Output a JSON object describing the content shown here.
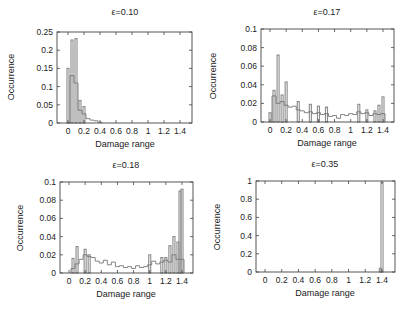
{
  "figure": {
    "panel_count": 4,
    "colors": {
      "frame": "#444444",
      "bar": "#8a8a8a",
      "step": "#777777",
      "dark": "#222222",
      "text": "#222222"
    }
  },
  "chart_data": [
    {
      "type": "bar",
      "title": "ε=0.10",
      "xlabel": "Damage range",
      "ylabel": "Occurrence",
      "xlim": [
        -0.1,
        1.55
      ],
      "ylim": [
        0,
        0.25
      ],
      "xticks": [
        "0",
        "0.2",
        "0.4",
        "0.6",
        "0.8",
        "1",
        "1.2",
        "1.4"
      ],
      "yticks": [
        "0",
        "0.05",
        "0.1",
        "0.15",
        "0.2",
        "0.25"
      ],
      "grid": false,
      "frame": {
        "left": 57,
        "top": 32,
        "right": 192,
        "bottom": 123,
        "x0px": 68,
        "x14px": 180
      },
      "bin_width": 0.025,
      "bars": [
        [
          0.0,
          0.15
        ],
        [
          0.05,
          0.228
        ],
        [
          0.1,
          0.232
        ],
        [
          0.15,
          0.062
        ],
        [
          0.2,
          0.045
        ]
      ],
      "step": [
        [
          0.0,
          0.0
        ],
        [
          0.025,
          0.13
        ],
        [
          0.075,
          0.11
        ],
        [
          0.125,
          0.035
        ],
        [
          0.175,
          0.025
        ],
        [
          0.225,
          0.012
        ],
        [
          0.275,
          0.008
        ],
        [
          0.325,
          0.006
        ],
        [
          0.375,
          0.002
        ],
        [
          0.425,
          0.0
        ]
      ]
    },
    {
      "type": "bar",
      "title": "ε=0.17",
      "xlabel": "Damage range",
      "ylabel": "Occurrence",
      "xlim": [
        -0.1,
        1.55
      ],
      "ylim": [
        0,
        0.1
      ],
      "xticks": [
        "0",
        "0.2",
        "0.4",
        "0.6",
        "0.8",
        "1",
        "1.2",
        "1.4"
      ],
      "yticks": [
        "0",
        "0.02",
        "0.04",
        "0.06",
        "0.08",
        "0.1"
      ],
      "grid": false,
      "frame": {
        "left": 261,
        "top": 29,
        "right": 394,
        "bottom": 122,
        "x0px": 270,
        "x14px": 383
      },
      "bin_width": 0.025,
      "bars": [
        [
          0.0,
          0.01
        ],
        [
          0.05,
          0.034
        ],
        [
          0.1,
          0.072
        ],
        [
          0.15,
          0.029
        ],
        [
          0.2,
          0.043
        ],
        [
          0.35,
          0.022
        ],
        [
          0.5,
          0.019
        ],
        [
          0.6,
          0.017
        ],
        [
          0.7,
          0.016
        ],
        [
          1.1,
          0.019
        ],
        [
          1.2,
          0.013
        ],
        [
          1.3,
          0.012
        ],
        [
          1.35,
          0.018
        ],
        [
          1.4,
          0.027
        ]
      ],
      "step": [
        [
          0.025,
          0.028
        ],
        [
          0.075,
          0.02
        ],
        [
          0.125,
          0.022
        ],
        [
          0.175,
          0.018
        ],
        [
          0.225,
          0.016
        ],
        [
          0.275,
          0.017
        ],
        [
          0.325,
          0.013
        ],
        [
          0.375,
          0.012
        ],
        [
          0.425,
          0.01
        ],
        [
          0.475,
          0.011
        ],
        [
          0.525,
          0.009
        ],
        [
          0.575,
          0.01
        ],
        [
          0.625,
          0.008
        ],
        [
          0.675,
          0.009
        ],
        [
          0.725,
          0.006
        ],
        [
          0.775,
          0.007
        ],
        [
          0.825,
          0.004
        ],
        [
          0.875,
          0.008
        ],
        [
          0.925,
          0.007
        ],
        [
          0.975,
          0.009
        ],
        [
          1.025,
          0.008
        ],
        [
          1.075,
          0.011
        ],
        [
          1.125,
          0.009
        ],
        [
          1.175,
          0.01
        ],
        [
          1.225,
          0.007
        ],
        [
          1.275,
          0.009
        ],
        [
          1.325,
          0.008
        ],
        [
          1.375,
          0.009
        ],
        [
          1.425,
          0.0
        ]
      ]
    },
    {
      "type": "bar",
      "title": "ε=0.18",
      "xlabel": "Damage range",
      "ylabel": "Occurrence",
      "xlim": [
        -0.1,
        1.55
      ],
      "ylim": [
        0,
        0.1
      ],
      "xticks": [
        "0",
        "0.2",
        "0.4",
        "0.6",
        "0.8",
        "1",
        "1.2",
        "1.4"
      ],
      "yticks": [
        "0",
        "0.02",
        "0.04",
        "0.06",
        "0.08",
        "0.1"
      ],
      "grid": false,
      "frame": {
        "left": 60,
        "top": 182,
        "right": 193,
        "bottom": 273,
        "x0px": 69,
        "x14px": 182
      },
      "bin_width": 0.025,
      "bars": [
        [
          0.05,
          0.016
        ],
        [
          0.1,
          0.029
        ],
        [
          0.2,
          0.026
        ],
        [
          0.25,
          0.02
        ],
        [
          1.0,
          0.02
        ],
        [
          1.15,
          0.017
        ],
        [
          1.2,
          0.017
        ],
        [
          1.25,
          0.03
        ],
        [
          1.3,
          0.04
        ],
        [
          1.35,
          0.034
        ],
        [
          1.375,
          0.09
        ],
        [
          1.4,
          0.092
        ]
      ],
      "step": [
        [
          0.025,
          0.005
        ],
        [
          0.075,
          0.01
        ],
        [
          0.125,
          0.015
        ],
        [
          0.175,
          0.02
        ],
        [
          0.225,
          0.018
        ],
        [
          0.275,
          0.017
        ],
        [
          0.325,
          0.013
        ],
        [
          0.375,
          0.011
        ],
        [
          0.425,
          0.014
        ],
        [
          0.475,
          0.009
        ],
        [
          0.525,
          0.012
        ],
        [
          0.575,
          0.007
        ],
        [
          0.625,
          0.008
        ],
        [
          0.675,
          0.006
        ],
        [
          0.725,
          0.007
        ],
        [
          0.775,
          0.005
        ],
        [
          0.825,
          0.008
        ],
        [
          0.875,
          0.006
        ],
        [
          0.925,
          0.007
        ],
        [
          0.975,
          0.009
        ],
        [
          1.025,
          0.013
        ],
        [
          1.075,
          0.01
        ],
        [
          1.125,
          0.012
        ],
        [
          1.175,
          0.014
        ],
        [
          1.225,
          0.012
        ],
        [
          1.275,
          0.02
        ],
        [
          1.325,
          0.015
        ],
        [
          1.425,
          0.0
        ]
      ]
    },
    {
      "type": "bar",
      "title": "ε=0.35",
      "xlabel": "Damage range",
      "ylabel": "Occurrence",
      "xlim": [
        -0.1,
        1.55
      ],
      "ylim": [
        0,
        1
      ],
      "xticks": [
        "0",
        "0.2",
        "0.4",
        "0.6",
        "0.8",
        "1",
        "1.2",
        "1.4"
      ],
      "yticks": [
        "0",
        "0.2",
        "0.4",
        "0.6",
        "0.8",
        "1"
      ],
      "grid": false,
      "frame": {
        "left": 256,
        "top": 181,
        "right": 395,
        "bottom": 272,
        "x0px": 265,
        "x14px": 382
      },
      "bin_width": 0.025,
      "bars": [
        [
          1.4,
          0.985
        ],
        [
          1.38,
          0.04
        ]
      ],
      "step": []
    }
  ]
}
